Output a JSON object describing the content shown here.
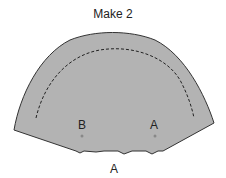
{
  "diagram": {
    "title": "Make 2",
    "labels": {
      "point_b": "B",
      "point_a": "A",
      "edge_a": "A"
    },
    "colors": {
      "fill": "#b3b3b3",
      "stroke": "#333333",
      "marker": "#888888"
    }
  }
}
